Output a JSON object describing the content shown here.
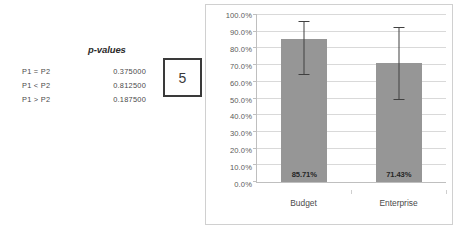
{
  "stats": {
    "header": "p-values",
    "rows": [
      {
        "hypothesis": "P1 = P2",
        "pvalue": "0.375000"
      },
      {
        "hypothesis": "P1 < P2",
        "pvalue": "0.812500"
      },
      {
        "hypothesis": "P1 > P2",
        "pvalue": "0.187500"
      }
    ]
  },
  "figure": {
    "number": "5"
  },
  "chart_data": {
    "type": "bar",
    "title": "",
    "xlabel": "",
    "ylabel": "",
    "categories": [
      "Budget",
      "Enterprise"
    ],
    "values": [
      85.71,
      71.43
    ],
    "data_labels": [
      "85.71%",
      "71.43%"
    ],
    "error_bars": [
      {
        "lower": 63.9,
        "upper": 96.5
      },
      {
        "lower": 48.9,
        "upper": 92.8
      }
    ],
    "ylim": [
      0,
      100
    ],
    "ytick_values": [
      0,
      10,
      20,
      30,
      40,
      50,
      60,
      70,
      80,
      90,
      100
    ],
    "ytick_labels": [
      "0.0%",
      "10.0%",
      "20.0%",
      "30.0%",
      "40.0%",
      "50.0%",
      "60.0%",
      "70.0%",
      "80.0%",
      "90.0%",
      "100.0%"
    ],
    "grid": true,
    "legend": false,
    "bar_color": "#969696",
    "errorbar_color": "#404040",
    "gridline_color": "#d9d9d9"
  }
}
